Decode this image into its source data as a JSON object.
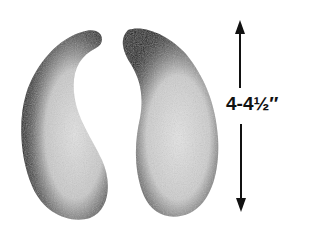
{
  "illustration": {
    "objects": [
      {
        "name": "left-crescent-piece",
        "shape": "kidney/crescent"
      },
      {
        "name": "right-crescent-piece",
        "shape": "kidney/crescent"
      }
    ],
    "dimension": {
      "label": "4-4½″",
      "orientation": "vertical",
      "arrows": [
        "up",
        "down"
      ]
    },
    "colors": {
      "background": "#ffffff",
      "ink": "#111111",
      "shade_dark": "#1a1a1a",
      "shade_light": "#d8d8d8"
    }
  }
}
